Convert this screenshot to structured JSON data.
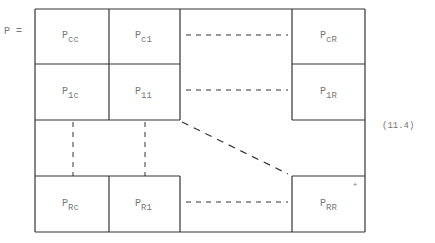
{
  "equation": {
    "lhs": "P =",
    "number": "(11.4)",
    "blocks": [
      {
        "id": "cc",
        "base": "P",
        "sub": "cc"
      },
      {
        "id": "c1",
        "base": "P",
        "sub": "c1"
      },
      {
        "id": "cR",
        "base": "P",
        "sub": "cR"
      },
      {
        "id": "1c",
        "base": "P",
        "sub": "1c"
      },
      {
        "id": "11",
        "base": "P",
        "sub": "11"
      },
      {
        "id": "1R",
        "base": "P",
        "sub": "1R"
      },
      {
        "id": "Rc",
        "base": "P",
        "sub": "Rc"
      },
      {
        "id": "R1",
        "base": "P",
        "sub": "R1"
      },
      {
        "id": "RR",
        "base": "P",
        "sub": "RR"
      }
    ],
    "mark": "+"
  }
}
